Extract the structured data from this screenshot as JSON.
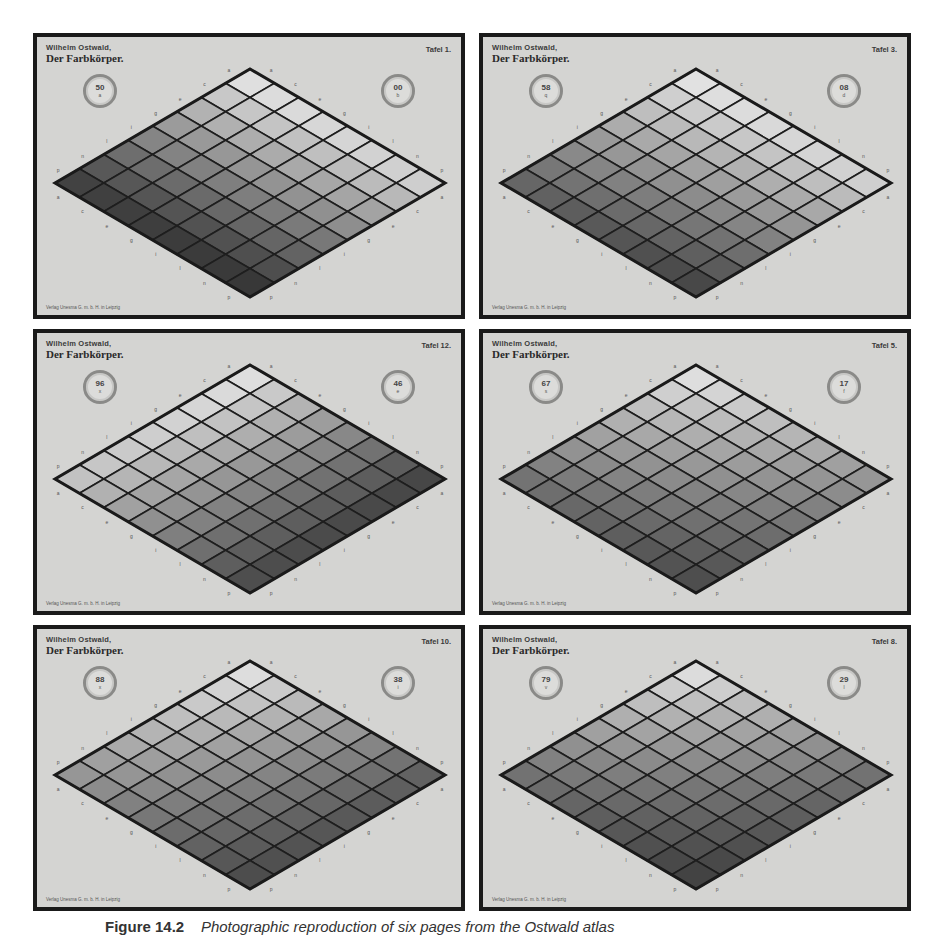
{
  "figure": {
    "caption_label": "Figure 14.2",
    "caption_text": "Photographic reproduction of six pages from the Ostwald atlas",
    "plates": [
      {
        "id": "tafel-1",
        "author": "Wilhelm Ostwald,",
        "title": "Der Farbkörper.",
        "tafel": "Tafel 1.",
        "left_disc": {
          "num": "50",
          "sub": "a"
        },
        "right_disc": {
          "num": "00",
          "sub": "b"
        },
        "publisher": "Verlag Unesma G. m. b. H. in Leipzig",
        "shading": {
          "top": 235,
          "left": 55,
          "right": 215,
          "bottom": 45
        },
        "position": {
          "col": 0,
          "row": 0
        }
      },
      {
        "id": "tafel-3",
        "author": "Wilhelm Ostwald,",
        "title": "Der Farbkörper.",
        "tafel": "Tafel 3.",
        "left_disc": {
          "num": "58",
          "sub": "q"
        },
        "right_disc": {
          "num": "08",
          "sub": "d"
        },
        "publisher": "Verlag Unesma G. m. b. H. in Leipzig",
        "shading": {
          "top": 235,
          "left": 95,
          "right": 215,
          "bottom": 60
        },
        "position": {
          "col": 1,
          "row": 0
        }
      },
      {
        "id": "tafel-12",
        "author": "Wilhelm Ostwald,",
        "title": "Der Farbkörper.",
        "tafel": "Tafel 12.",
        "left_disc": {
          "num": "96",
          "sub": "x"
        },
        "right_disc": {
          "num": "46",
          "sub": "e"
        },
        "publisher": "Verlag Unesma G. m. b. H. in Leipzig",
        "shading": {
          "top": 235,
          "left": 200,
          "right": 60,
          "bottom": 70
        },
        "position": {
          "col": 0,
          "row": 1
        }
      },
      {
        "id": "tafel-5",
        "author": "Wilhelm Ostwald,",
        "title": "Der Farbkörper.",
        "tafel": "Tafel 5.",
        "left_disc": {
          "num": "67",
          "sub": "s"
        },
        "right_disc": {
          "num": "17",
          "sub": "f"
        },
        "publisher": "Verlag Unesma G. m. b. H. in Leipzig",
        "shading": {
          "top": 235,
          "left": 110,
          "right": 150,
          "bottom": 70
        },
        "position": {
          "col": 1,
          "row": 1
        }
      },
      {
        "id": "tafel-10",
        "author": "Wilhelm Ostwald,",
        "title": "Der Farbkörper.",
        "tafel": "Tafel 10.",
        "left_disc": {
          "num": "88",
          "sub": "x"
        },
        "right_disc": {
          "num": "38",
          "sub": "i"
        },
        "publisher": "Verlag Unesma G. m. b. H. in Leipzig",
        "shading": {
          "top": 235,
          "left": 150,
          "right": 90,
          "bottom": 70
        },
        "position": {
          "col": 0,
          "row": 2
        }
      },
      {
        "id": "tafel-8",
        "author": "Wilhelm Ostwald,",
        "title": "Der Farbkörper.",
        "tafel": "Tafel 8.",
        "left_disc": {
          "num": "79",
          "sub": "v"
        },
        "right_disc": {
          "num": "29",
          "sub": "l"
        },
        "publisher": "Verlag Unesma G. m. b. H. in Leipzig",
        "shading": {
          "top": 235,
          "left": 110,
          "right": 110,
          "bottom": 60
        },
        "position": {
          "col": 1,
          "row": 2
        }
      }
    ],
    "grid_size": 8,
    "edge_labels": [
      "a",
      "c",
      "e",
      "g",
      "i",
      "l",
      "n",
      "p"
    ]
  }
}
